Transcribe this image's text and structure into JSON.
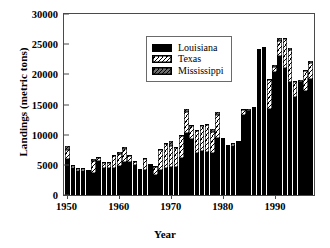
{
  "chart_data": {
    "type": "bar",
    "subtype": "stacked-bar",
    "title": "",
    "xlabel": "Year",
    "ylabel": "Landings (metric tons)",
    "ylim": [
      0,
      30000
    ],
    "yticks": [
      0,
      5000,
      10000,
      15000,
      20000,
      25000,
      30000
    ],
    "ytick_labels": [
      "0",
      "5000",
      "10000",
      "15000",
      "20000",
      "25000",
      "30000"
    ],
    "xticks": [
      1950,
      1960,
      1970,
      1980,
      1990
    ],
    "xtick_labels": [
      "1950",
      "1960",
      "1970",
      "1980",
      "1990"
    ],
    "grid": false,
    "legend_position": "upper-left-inside",
    "categories": [
      1950,
      1951,
      1952,
      1953,
      1954,
      1955,
      1956,
      1957,
      1958,
      1959,
      1960,
      1961,
      1962,
      1963,
      1964,
      1965,
      1966,
      1967,
      1968,
      1969,
      1970,
      1971,
      1972,
      1973,
      1974,
      1975,
      1976,
      1977,
      1978,
      1979,
      1980,
      1981,
      1982,
      1983,
      1984,
      1985,
      1986,
      1987,
      1988,
      1989,
      1990,
      1991,
      1992,
      1993,
      1994,
      1995,
      1996,
      1997
    ],
    "series": [
      {
        "name": "Louisiana",
        "color": "#000000",
        "pattern": "solid",
        "values": [
          6000,
          4400,
          4000,
          4000,
          3900,
          3700,
          5600,
          4500,
          4400,
          4500,
          4800,
          5500,
          5400,
          5000,
          3900,
          4100,
          4800,
          3300,
          4200,
          4400,
          4700,
          4600,
          6100,
          10300,
          9300,
          7000,
          7300,
          7200,
          6900,
          9500,
          9400,
          8200,
          8200,
          8700,
          13300,
          14000,
          14200,
          24000,
          24400,
          14300,
          20400,
          23000,
          21000,
          18800,
          16300,
          18800,
          17200,
          19300
        ]
      },
      {
        "name": "Texas",
        "color": "#ffffff",
        "pattern": "diagonal-hatch",
        "values": [
          1400,
          400,
          300,
          300,
          200,
          1900,
          500,
          800,
          900,
          1900,
          2000,
          2200,
          1100,
          400,
          300,
          1900,
          200,
          1300,
          3300,
          4000,
          3500,
          3200,
          3700,
          3500,
          2200,
          3600,
          4100,
          4400,
          3600,
          3800,
          0,
          0,
          300,
          100,
          800,
          0,
          200,
          0,
          0,
          4700,
          900,
          2500,
          4900,
          5300,
          2400,
          0,
          3300,
          2600
        ]
      },
      {
        "name": "Mississippi",
        "color": "#5c5c5c",
        "pattern": "diagonal-hatch",
        "values": [
          700,
          200,
          200,
          200,
          100,
          400,
          200,
          200,
          200,
          200,
          400,
          300,
          200,
          200,
          100,
          200,
          100,
          200,
          200,
          300,
          700,
          200,
          200,
          400,
          100,
          200,
          200,
          200,
          400,
          400,
          100,
          100,
          100,
          100,
          200,
          200,
          200,
          200,
          100,
          300,
          200,
          500,
          200,
          300,
          200,
          200,
          300,
          300
        ]
      }
    ]
  },
  "legend": {
    "items": [
      {
        "label": "Louisiana"
      },
      {
        "label": "Texas"
      },
      {
        "label": "Mississippi"
      }
    ]
  }
}
